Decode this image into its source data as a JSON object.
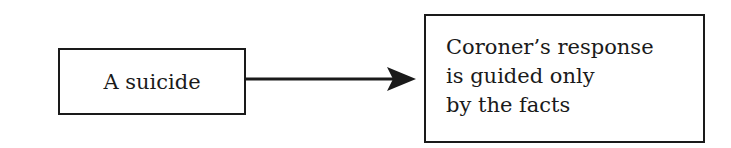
{
  "diagram": {
    "type": "flow",
    "nodes": [
      {
        "id": "source",
        "label": "A suicide"
      },
      {
        "id": "target",
        "lines": [
          "Coroner’s response",
          "is guided only",
          "by the facts"
        ]
      }
    ],
    "edges": [
      {
        "from": "source",
        "to": "target",
        "style": "solid-arrow"
      }
    ],
    "colors": {
      "stroke": "#1a1a1a",
      "background": "#ffffff"
    }
  }
}
